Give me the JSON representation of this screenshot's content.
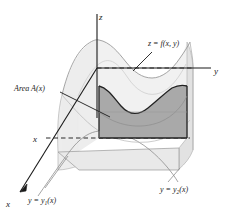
{
  "figure": {
    "axes": {
      "x_label": "x",
      "y_label": "y",
      "z_label": "z",
      "x_tick_label": "x"
    },
    "labels": {
      "surface": "z = f(x, y)",
      "surface_lhs": "z",
      "surface_eq": "=",
      "surface_rhs": "f(x, y)",
      "area": "Area A(x)",
      "boundary_front": "y = y",
      "boundary_front_sub": "1",
      "boundary_front_tail": "(x)",
      "boundary_back": "y = y",
      "boundary_back_sub": "2",
      "boundary_back_tail": "(x)"
    },
    "colors": {
      "background": "#ffffff",
      "stroke_dark": "#1a1a1a",
      "stroke_mid": "#7d7d7d",
      "stroke_light": "#b0b0b0",
      "fill_cross_section": "#a9a9a9",
      "fill_surface_light": "#ececec",
      "fill_base": "#e4e4e4",
      "fill_side": "#d8d8d8",
      "dashed": "#2b2b2b"
    },
    "geometry": {
      "origin": {
        "x": 97,
        "y": 68
      },
      "z_axis_top": {
        "x": 97,
        "y": 14
      },
      "y_axis_end": {
        "x": 213,
        "y": 68
      },
      "x_axis_end": {
        "x": 16,
        "y": 196
      },
      "cross_section_rect": {
        "left": 99,
        "top": 86,
        "right": 187,
        "bottom": 138
      },
      "dashed_upper_y": 68,
      "dashed_lower_y": 138
    }
  }
}
